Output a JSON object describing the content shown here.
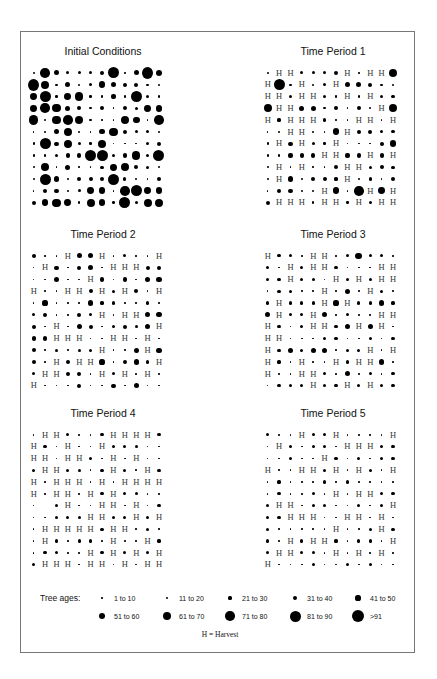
{
  "figure": {
    "panels": [
      {
        "title": "Initial Conditions"
      },
      {
        "title": "Time Period 1"
      },
      {
        "title": "Time Period 2"
      },
      {
        "title": "Time Period 3"
      },
      {
        "title": "Time Period 4"
      },
      {
        "title": "Time Period 5"
      }
    ],
    "legend": {
      "title": "Tree ages:",
      "classes": [
        "1 to 10",
        "11 to 20",
        "21 to 30",
        "31 to 40",
        "41 to 50",
        "51 to 60",
        "61 to 70",
        "71 to 80",
        "81 to 90",
        ">91"
      ],
      "harvest_note": "H = Harvest",
      "harvest_symbol": "H"
    }
  },
  "chart_data": {
    "type": "scatter",
    "legend": [
      "1 to 10",
      "11 to 20",
      "21 to 30",
      "31 to 40",
      "41 to 50",
      "51 to 60",
      "61 to 70",
      "71 to 80",
      "81 to 90",
      ">91",
      "H = Harvest"
    ],
    "grids": [
      {
        "title": "Initial Conditions",
        "rows": [
          [
            2,
            8,
            5,
            3,
            3,
            3,
            4,
            9,
            1,
            5,
            10,
            6
          ],
          [
            10,
            7,
            2,
            5,
            2,
            3,
            6,
            5,
            4,
            4,
            2,
            2
          ],
          [
            6,
            9,
            2,
            6,
            7,
            2,
            2,
            4,
            2,
            9,
            3,
            2
          ],
          [
            6,
            8,
            7,
            5,
            4,
            2,
            4,
            1,
            4,
            3,
            6,
            6
          ],
          [
            8,
            2,
            7,
            8,
            7,
            2,
            1,
            1,
            7,
            6,
            1,
            8
          ],
          [
            1,
            2,
            5,
            7,
            2,
            1,
            5,
            7,
            4,
            3,
            3,
            2
          ],
          [
            2,
            9,
            4,
            7,
            3,
            2,
            7,
            1,
            1,
            1,
            3,
            4
          ],
          [
            2,
            2,
            3,
            4,
            4,
            9,
            9,
            3,
            4,
            7,
            3,
            9
          ],
          [
            2,
            7,
            1,
            5,
            1,
            1,
            3,
            6,
            7,
            4,
            3,
            2
          ],
          [
            2,
            9,
            5,
            2,
            4,
            4,
            4,
            9,
            3,
            2,
            1,
            4
          ],
          [
            1,
            4,
            4,
            2,
            3,
            6,
            6,
            1,
            8,
            9,
            6,
            6
          ],
          [
            4,
            6,
            7,
            6,
            2,
            7,
            6,
            2,
            9,
            3,
            7,
            7
          ]
        ]
      },
      {
        "title": "Time Period 1",
        "rows": [
          [
            2,
            "H",
            "H",
            3,
            3,
            3,
            4,
            "H",
            1,
            "H",
            "H",
            7
          ],
          [
            "H",
            9,
            2,
            "H",
            2,
            3,
            "H",
            5,
            5,
            4,
            2,
            2
          ],
          [
            "H",
            "H",
            3,
            "H",
            "H",
            3,
            2,
            "H",
            2,
            "H",
            3,
            3
          ],
          [
            7,
            "H",
            "H",
            5,
            5,
            2,
            4,
            1,
            4,
            2,
            "H",
            7
          ],
          [
            "H",
            3,
            "H",
            "H",
            "H",
            3,
            1,
            1,
            "H",
            "H",
            1,
            "H"
          ],
          [
            1,
            2,
            "H",
            "H",
            2,
            1,
            6,
            "H",
            4,
            4,
            3,
            3
          ],
          [
            2,
            "H",
            4,
            "H",
            3,
            2,
            "H",
            1,
            1,
            1,
            4,
            6
          ],
          [
            2,
            2,
            4,
            4,
            4,
            "H",
            "H",
            4,
            4,
            "H",
            4,
            "H"
          ],
          [
            2,
            "H",
            1,
            "H",
            1,
            1,
            4,
            "H",
            "H",
            3,
            4,
            3
          ],
          [
            2,
            "H",
            5,
            2,
            4,
            4,
            3,
            "H",
            2,
            3,
            1,
            4
          ],
          [
            1,
            4,
            4,
            2,
            2,
            "H",
            6,
            1,
            8,
            "H",
            6,
            "H"
          ],
          [
            4,
            "H",
            "H",
            "H",
            2,
            "H",
            "H",
            2,
            "H",
            3,
            "H",
            "H"
          ]
        ]
      },
      {
        "title": "Time Period 2",
        "rows": [
          [
            4,
            1,
            1,
            "H",
            5,
            5,
            "H",
            1,
            3,
            1,
            1,
            "H"
          ],
          [
            1,
            "H",
            4,
            1,
            4,
            5,
            1,
            "H",
            "H",
            "H",
            4,
            4
          ],
          [
            1,
            1,
            5,
            1,
            1,
            "H",
            4,
            1,
            4,
            1,
            5,
            5
          ],
          [
            "H",
            1,
            1,
            "H",
            "H",
            4,
            "H",
            3,
            "H",
            4,
            1,
            "H"
          ],
          [
            1,
            5,
            1,
            1,
            1,
            5,
            3,
            3,
            1,
            1,
            3,
            1
          ],
          [
            3,
            4,
            1,
            1,
            4,
            3,
            "H",
            1,
            "H",
            "H",
            5,
            5
          ],
          [
            4,
            1,
            "H",
            1,
            5,
            4,
            1,
            3,
            4,
            3,
            5,
            "H"
          ],
          [
            4,
            4,
            "H",
            "H",
            "H",
            1,
            1,
            "H",
            "H",
            1,
            "H",
            1
          ],
          [
            4,
            1,
            3,
            1,
            3,
            3,
            "H",
            1,
            1,
            5,
            "H",
            5
          ],
          [
            4,
            1,
            "H",
            4,
            "H",
            "H",
            5,
            1,
            4,
            5,
            3,
            "H"
          ],
          [
            3,
            "H",
            "H",
            4,
            4,
            1,
            "H",
            3,
            "H",
            1,
            "H",
            1
          ],
          [
            "H",
            1,
            1,
            1,
            4,
            1,
            1,
            4,
            1,
            5,
            1,
            1
          ]
        ]
      },
      {
        "title": "Time Period 3",
        "rows": [
          [
            "H",
            3,
            3,
            1,
            "H",
            "H",
            1,
            3,
            6,
            3,
            3,
            1
          ],
          [
            3,
            1,
            "H",
            3,
            "H",
            "H",
            3,
            1,
            1,
            1,
            "H",
            "H"
          ],
          [
            3,
            3,
            "H",
            3,
            3,
            1,
            "H",
            3,
            "H",
            3,
            "H",
            "H"
          ],
          [
            1,
            3,
            3,
            1,
            1,
            "H",
            1,
            5,
            1,
            "H",
            3,
            1
          ],
          [
            3,
            "H",
            3,
            3,
            3,
            "H",
            5,
            "H",
            3,
            3,
            5,
            3
          ],
          [
            5,
            "H",
            3,
            3,
            "H",
            5,
            1,
            3,
            1,
            1,
            "H",
            "H"
          ],
          [
            "H",
            3,
            1,
            3,
            "H",
            "H",
            3,
            5,
            "H",
            5,
            "H",
            1
          ],
          [
            "H",
            "H",
            1,
            1,
            1,
            3,
            3,
            1,
            1,
            3,
            1,
            3
          ],
          [
            "H",
            3,
            5,
            3,
            5,
            5,
            1,
            3,
            3,
            "H",
            1,
            "H"
          ],
          [
            "H",
            3,
            1,
            "H",
            1,
            1,
            "H",
            3,
            "H",
            "H",
            5,
            1
          ],
          [
            "H",
            1,
            1,
            "H",
            "H",
            3,
            1,
            5,
            1,
            3,
            1,
            3
          ],
          [
            1,
            3,
            3,
            3,
            "H",
            3,
            3,
            "H",
            3,
            "H",
            3,
            3
          ]
        ]
      },
      {
        "title": "Time Period 4",
        "rows": [
          [
            1,
            "H",
            "H",
            3,
            1,
            1,
            3,
            "H",
            "H",
            "H",
            "H",
            3
          ],
          [
            "H",
            3,
            1,
            "H",
            1,
            1,
            "H",
            3,
            3,
            3,
            1,
            1
          ],
          [
            "H",
            "H",
            1,
            "H",
            "H",
            3,
            1,
            "H",
            1,
            "H",
            1,
            1
          ],
          [
            3,
            "H",
            "H",
            3,
            3,
            1,
            3,
            "H",
            3,
            1,
            "H",
            3
          ],
          [
            "H",
            1,
            "H",
            "H",
            "H",
            1,
            "H",
            1,
            "H",
            "H",
            "H",
            "H"
          ],
          [
            "H",
            1,
            "H",
            "H",
            1,
            "H",
            3,
            "H",
            3,
            3,
            1,
            1
          ],
          [
            1,
            0,
            3,
            "H",
            1,
            1,
            "H",
            "H",
            1,
            "H",
            1,
            3
          ],
          [
            1,
            1,
            3,
            3,
            3,
            "H",
            "H",
            3,
            3,
            "H",
            3,
            "H"
          ],
          [
            1,
            "H",
            "H",
            "H",
            "H",
            "H",
            3,
            "H",
            "H",
            1,
            3,
            1
          ],
          [
            1,
            "H",
            3,
            1,
            3,
            3,
            1,
            "H",
            1,
            1,
            "H",
            3
          ],
          [
            1,
            3,
            3,
            1,
            1,
            "H",
            3,
            "H",
            3,
            "H",
            3,
            "H"
          ],
          [
            3,
            "H",
            "H",
            "H",
            1,
            "H",
            "H",
            1,
            "H",
            1,
            "H",
            "H"
          ]
        ]
      },
      {
        "title": "Time Period 5",
        "rows": [
          [
            3,
            1,
            1,
            "H",
            3,
            3,
            "H",
            1,
            1,
            1,
            1,
            "H"
          ],
          [
            1,
            "H",
            3,
            1,
            3,
            3,
            1,
            "H",
            "H",
            "H",
            3,
            3
          ],
          [
            1,
            1,
            3,
            1,
            1,
            "H",
            3,
            1,
            3,
            1,
            3,
            3
          ],
          [
            "H",
            1,
            1,
            "H",
            "H",
            3,
            "H",
            1,
            "H",
            3,
            1,
            "H"
          ],
          [
            1,
            3,
            1,
            1,
            1,
            3,
            1,
            3,
            1,
            1,
            1,
            1
          ],
          [
            1,
            3,
            1,
            1,
            3,
            1,
            "H",
            1,
            "H",
            "H",
            3,
            3
          ],
          [
            3,
            "H",
            "H",
            1,
            3,
            3,
            1,
            1,
            3,
            1,
            3,
            "H"
          ],
          [
            3,
            3,
            "H",
            "H",
            "H",
            1,
            1,
            "H",
            "H",
            1,
            "H",
            1
          ],
          [
            3,
            1,
            1,
            1,
            1,
            1,
            "H",
            1,
            1,
            3,
            "H",
            3
          ],
          [
            3,
            1,
            "H",
            3,
            "H",
            "H",
            3,
            1,
            3,
            3,
            1,
            "H"
          ],
          [
            3,
            "H",
            "H",
            3,
            3,
            1,
            "H",
            1,
            "H",
            1,
            "H",
            1
          ],
          [
            "H",
            1,
            1,
            1,
            3,
            1,
            1,
            3,
            1,
            3,
            1,
            1
          ]
        ]
      }
    ]
  }
}
